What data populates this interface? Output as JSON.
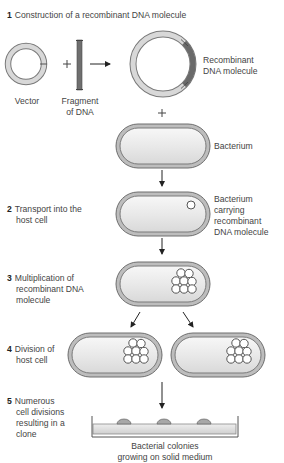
{
  "figure": {
    "steps": [
      {
        "number": "1",
        "lines": [
          "Construction of a recombinant DNA molecule"
        ]
      },
      {
        "number": "2",
        "lines": [
          "Transport into the",
          "host cell"
        ]
      },
      {
        "number": "3",
        "lines": [
          "Multiplication of",
          "recombinant DNA",
          "molecule"
        ]
      },
      {
        "number": "4",
        "lines": [
          "Division of",
          "host cell"
        ]
      },
      {
        "number": "5",
        "lines": [
          "Numerous",
          "cell divisions",
          "resulting in a",
          "clone"
        ]
      }
    ],
    "labels": {
      "vector": "Vector",
      "fragment": [
        "Fragment",
        "of DNA"
      ],
      "recombinant": [
        "Recombinant",
        "DNA molecule"
      ],
      "bacterium": "Bacterium",
      "bacterium_carrying": [
        "Bacterium",
        "carrying",
        "recombinant",
        "DNA molecule"
      ],
      "colonies": [
        "Bacterial colonies",
        "growing on solid medium"
      ],
      "plus": "+"
    },
    "colors": {
      "ring_fill": "#d6d6d6",
      "ring_stroke": "#7a7a7a",
      "fragment": "#6f6f6f",
      "cell_wall": "#8c8c8c",
      "cell_inner": "#ebebeb",
      "arrow": "#222222"
    }
  }
}
